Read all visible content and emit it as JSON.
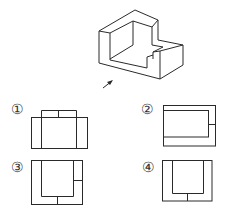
{
  "figure": {
    "object": "isometric-L-shaped-block",
    "view_direction": "arrow",
    "line_color": "#2a2a2a"
  },
  "options": [
    {
      "label": "①"
    },
    {
      "label": "②"
    },
    {
      "label": "③"
    },
    {
      "label": "④"
    }
  ]
}
